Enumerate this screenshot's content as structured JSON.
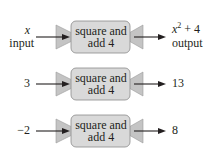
{
  "machines": [
    {
      "input": "x",
      "input_label": "input",
      "box_line1": "square and",
      "box_line2": "add 4",
      "output_base": "x",
      "output_exp": "2",
      "output_rest": " + 4",
      "output_label": "output"
    },
    {
      "input": "3",
      "box_line1": "square and",
      "box_line2": "add 4",
      "output": "13"
    },
    {
      "input": "−2",
      "box_line1": "square and",
      "box_line2": "add 4",
      "output": "8"
    }
  ],
  "colors": {
    "box_fill": "#d9d9d9",
    "funnel_fill": "#c8c8c8",
    "stroke": "#231f20"
  }
}
